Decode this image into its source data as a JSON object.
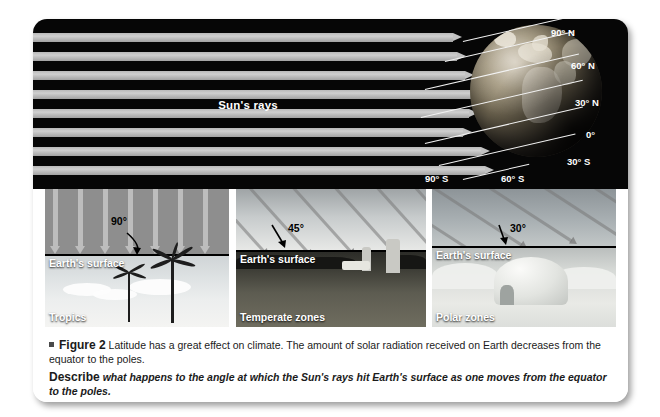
{
  "diagram": {
    "sun_rays_label": "Sun's rays",
    "latitude_labels": [
      "90° N",
      "60° N",
      "30° N",
      "0°",
      "30° S",
      "60° S",
      "90° S"
    ]
  },
  "panels": [
    {
      "zone": "Tropics",
      "surface_label": "Earth's surface",
      "angle": "90°",
      "scene": "tropical-beach-palm-trees"
    },
    {
      "zone": "Temperate zones",
      "surface_label": "Earth's surface",
      "angle": "45°",
      "scene": "farmland-with-silos"
    },
    {
      "zone": "Polar zones",
      "surface_label": "Earth's surface",
      "angle": "30°",
      "scene": "snow-igloo"
    }
  ],
  "caption": {
    "figure_number": "Figure 2",
    "body": "Latitude has a great effect on climate. The amount of solar radiation received on Earth decreases from the equator to the poles.",
    "prompt_label": "Describe",
    "prompt_text": "what happens to the angle at which the Sun's rays hit Earth's surface as one moves from the equator to the poles."
  },
  "colors": {
    "diagram_background": "#060606",
    "ray": "#c2c2c2",
    "card_background": "#ffffff",
    "page_background": "#ffffff"
  }
}
